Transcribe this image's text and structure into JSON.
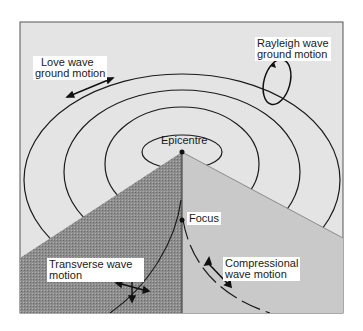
{
  "diagram": {
    "labels": {
      "love_wave": [
        "Love wave",
        "ground motion"
      ],
      "rayleigh_wave": [
        "Rayleigh wave",
        "ground motion"
      ],
      "epicentre": "Epicentre",
      "focus": "Focus",
      "transverse_wave": [
        "Transverse wave",
        "motion"
      ],
      "compressional_wave": [
        "Compressional",
        "wave motion"
      ]
    },
    "colors": {
      "surface": "#e4e4e4",
      "left_section": "#8a8a8a",
      "right_section": "#c9c9c9",
      "lines": "#1a1a1a",
      "frame": "#555555"
    }
  }
}
